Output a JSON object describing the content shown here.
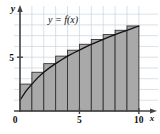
{
  "figure": {
    "name": "riemann-sum-right-endpoint-figure",
    "curve_label": "y = f(x)",
    "x_axis_name": "x",
    "y_axis_name": "y",
    "origin_label": "0"
  },
  "colors": {
    "bar_fill": "#a9a9a9",
    "bar_stroke": "#333333",
    "curve": "#111111",
    "axis": "#444444",
    "grid": "#c9d4dd",
    "background": "#ffffff",
    "text": "#111111"
  },
  "chart_data": {
    "type": "bar",
    "title": "",
    "subtitle": "",
    "xlabel": "x",
    "ylabel": "y",
    "curve_label": "y = f(x)",
    "grid": true,
    "legend": "none",
    "xlim": [
      0,
      10.6
    ],
    "ylim": [
      0,
      9.2
    ],
    "x_ticks": [
      0,
      5,
      10
    ],
    "x_tick_labels": [
      "0",
      "5",
      "10"
    ],
    "y_ticks": [
      5
    ],
    "y_tick_labels": [
      "5"
    ],
    "n_rectangles": 10,
    "rule": "right-endpoint",
    "interval_width": 1,
    "categories": [
      "0-1",
      "1-2",
      "2-3",
      "3-4",
      "4-5",
      "5-6",
      "6-7",
      "7-8",
      "8-9",
      "9-10"
    ],
    "bar_left_edges": [
      0,
      1,
      2,
      3,
      4,
      5,
      6,
      7,
      8,
      9
    ],
    "bar_right_edges": [
      1,
      2,
      3,
      4,
      5,
      6,
      7,
      8,
      9,
      10
    ],
    "values": [
      2.5,
      3.6,
      4.4,
      5.1,
      5.65,
      6.2,
      6.65,
      7.1,
      7.5,
      7.9
    ],
    "series": [
      {
        "name": "Right-endpoint rectangles",
        "values": [
          2.5,
          3.6,
          4.4,
          5.1,
          5.65,
          6.2,
          6.65,
          7.1,
          7.5,
          7.9
        ]
      },
      {
        "name": "y = f(x)",
        "x": [
          0,
          0.5,
          1,
          1.5,
          2,
          2.5,
          3,
          3.5,
          4,
          4.5,
          5,
          5.5,
          6,
          6.5,
          7,
          7.5,
          8,
          8.5,
          9,
          9.5,
          10
        ],
        "values": [
          1.0,
          1.85,
          2.5,
          3.1,
          3.6,
          4.03,
          4.4,
          4.76,
          5.1,
          5.39,
          5.65,
          5.93,
          6.2,
          6.43,
          6.65,
          6.88,
          7.1,
          7.3,
          7.5,
          7.7,
          7.9
        ]
      }
    ]
  }
}
